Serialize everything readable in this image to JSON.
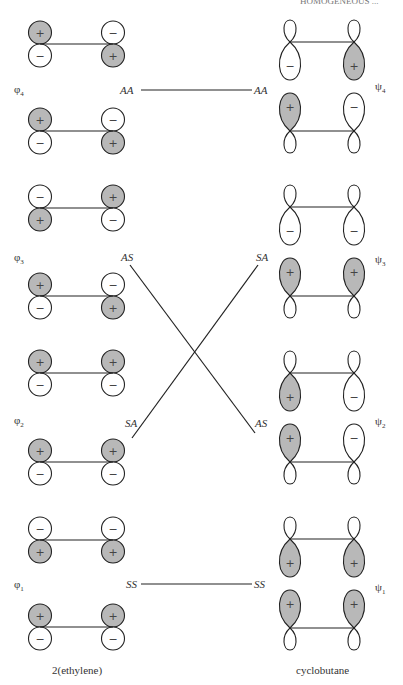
{
  "header": {
    "running_head": "HOMOGENEOUS ..."
  },
  "left_caption": "2(ethylene)",
  "right_caption": "cyclobutane",
  "colors": {
    "shaded": "#b8b8b8",
    "line": "#222222",
    "unshaded": "#ffffff"
  },
  "ethylene_levels": [
    {
      "label": "φ",
      "sub": "4",
      "symmetry": "AA",
      "pairs": [
        {
          "left": [
            "+",
            "−"
          ],
          "right": [
            "−",
            "+"
          ]
        },
        {
          "left": [
            "+",
            "−"
          ],
          "right": [
            "−",
            "+"
          ]
        }
      ]
    },
    {
      "label": "φ",
      "sub": "3",
      "symmetry": "AS",
      "pairs": [
        {
          "left": [
            "−",
            "+"
          ],
          "right": [
            "+",
            "−"
          ]
        },
        {
          "left": [
            "+",
            "−"
          ],
          "right": [
            "−",
            "+"
          ]
        }
      ]
    },
    {
      "label": "φ",
      "sub": "2",
      "symmetry": "SA",
      "pairs": [
        {
          "left": [
            "+",
            "−"
          ],
          "right": [
            "+",
            "−"
          ]
        },
        {
          "left": [
            "+",
            "−"
          ],
          "right": [
            "+",
            "−"
          ]
        }
      ]
    },
    {
      "label": "φ",
      "sub": "1",
      "symmetry": "SS",
      "pairs": [
        {
          "left": [
            "−",
            "+"
          ],
          "right": [
            "−",
            "+"
          ]
        },
        {
          "left": [
            "+",
            "−"
          ],
          "right": [
            "+",
            "−"
          ]
        }
      ]
    }
  ],
  "cyclobutane_levels": [
    {
      "label": "ψ",
      "sub": "4",
      "symmetry": "AA",
      "lobes": {
        "top_left": "−",
        "top_right": "+",
        "bottom_left": "+",
        "bottom_right": "−"
      }
    },
    {
      "label": "ψ",
      "sub": "3",
      "symmetry": "SA",
      "lobes": {
        "top_left": "−",
        "top_right": "−",
        "bottom_left": "+",
        "bottom_right": "+"
      }
    },
    {
      "label": "ψ",
      "sub": "2",
      "symmetry": "AS",
      "lobes": {
        "top_left": "+",
        "top_right": "−",
        "bottom_left": "+",
        "bottom_right": "−"
      }
    },
    {
      "label": "ψ",
      "sub": "1",
      "symmetry": "SS",
      "lobes": {
        "top_left": "+",
        "top_right": "+",
        "bottom_left": "+",
        "bottom_right": "+"
      }
    }
  ],
  "correlations": [
    {
      "from": "AA",
      "to": "AA",
      "type": "horizontal"
    },
    {
      "from": "AS",
      "to": "AS",
      "type": "crossing"
    },
    {
      "from": "SA",
      "to": "SA",
      "type": "crossing"
    },
    {
      "from": "SS",
      "to": "SS",
      "type": "horizontal"
    }
  ]
}
